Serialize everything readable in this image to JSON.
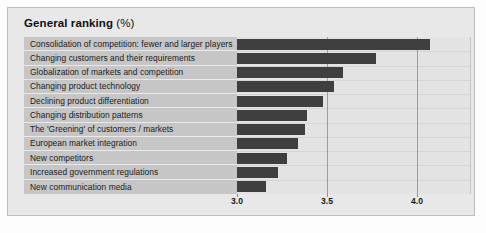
{
  "title": {
    "main": "General ranking",
    "unit": "(%)"
  },
  "colors": {
    "bar": "#3f3f3f",
    "label_band": "#c6c6c6",
    "plot_background": "#e3e3e3",
    "panel_background": "#e8e8e8",
    "gridline": "#9d9d9d"
  },
  "chart_data": {
    "type": "bar",
    "orientation": "horizontal",
    "title": "General ranking (%)",
    "xlabel": "",
    "ylabel": "",
    "xlim": [
      3.0,
      4.3
    ],
    "xticks": [
      3.0,
      3.5,
      4.0
    ],
    "xtick_labels": [
      "3.0",
      "3.5",
      "4.0"
    ],
    "grid": true,
    "legend": "none",
    "categories": [
      "Consolidation of competition: fewer and larger players",
      "Changing customers and their requirements",
      "Globalization of markets and competition",
      "Changing product technology",
      "Declining product differentiation",
      "Changing distribution patterns",
      "The 'Greening' of customers / markets",
      "European market integration",
      "New competitors",
      "Increased government regulations",
      "New communication media"
    ],
    "values": [
      4.07,
      3.77,
      3.59,
      3.54,
      3.48,
      3.39,
      3.38,
      3.34,
      3.28,
      3.23,
      3.16
    ]
  }
}
